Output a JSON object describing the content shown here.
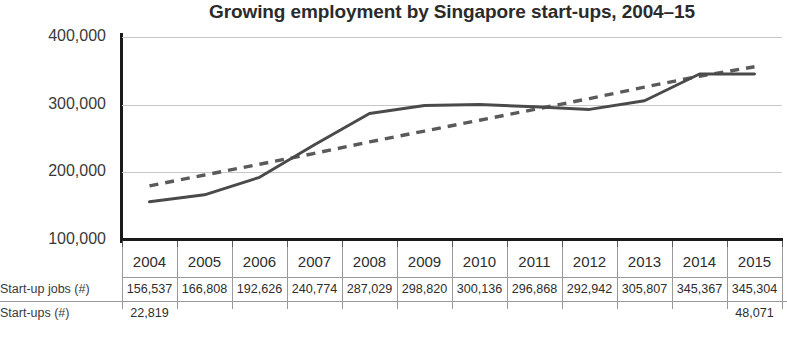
{
  "chart_data": {
    "type": "line",
    "title": "Growing employment by Singapore start-ups, 2004–15",
    "xlabel": "",
    "ylabel": "",
    "ylim": [
      100000,
      400000
    ],
    "ytick_labels": [
      "400,000",
      "300,000",
      "200,000",
      "100,000"
    ],
    "ytick_values": [
      400000,
      300000,
      200000,
      100000
    ],
    "grid": "horizontal",
    "legend": "none",
    "categories": [
      "2004",
      "2005",
      "2006",
      "2007",
      "2008",
      "2009",
      "2010",
      "2011",
      "2012",
      "2013",
      "2014",
      "2015"
    ],
    "series": [
      {
        "name": "Start-up jobs (#)",
        "style": "solid",
        "color": "#4a4a4a",
        "values": [
          156537,
          166808,
          192626,
          240774,
          287029,
          298820,
          300136,
          296868,
          292942,
          305807,
          345367,
          345304
        ]
      },
      {
        "name": "Trendline",
        "style": "dashed",
        "color": "#5a5a5a",
        "values": [
          180000,
          196000,
          212000,
          228000,
          245000,
          261000,
          277000,
          293000,
          309000,
          326000,
          342000,
          356000
        ]
      }
    ]
  },
  "title": "Growing employment by Singapore start-ups, 2004–15",
  "axis": {
    "y_labels": [
      "400,000",
      "300,000",
      "200,000",
      "100,000"
    ]
  },
  "table": {
    "years": [
      "2004",
      "2005",
      "2006",
      "2007",
      "2008",
      "2009",
      "2010",
      "2011",
      "2012",
      "2013",
      "2014",
      "2015"
    ],
    "rows": [
      {
        "label": "Start-up jobs (#)",
        "values": [
          "156,537",
          "166,808",
          "192,626",
          "240,774",
          "287,029",
          "298,820",
          "300,136",
          "296,868",
          "292,942",
          "305,807",
          "345,367",
          "345,304"
        ]
      },
      {
        "label": "Start-ups (#)",
        "values": [
          "22,819",
          "",
          "",
          "",
          "",
          "",
          "",
          "",
          "",
          "",
          "",
          "48,071"
        ]
      }
    ]
  }
}
